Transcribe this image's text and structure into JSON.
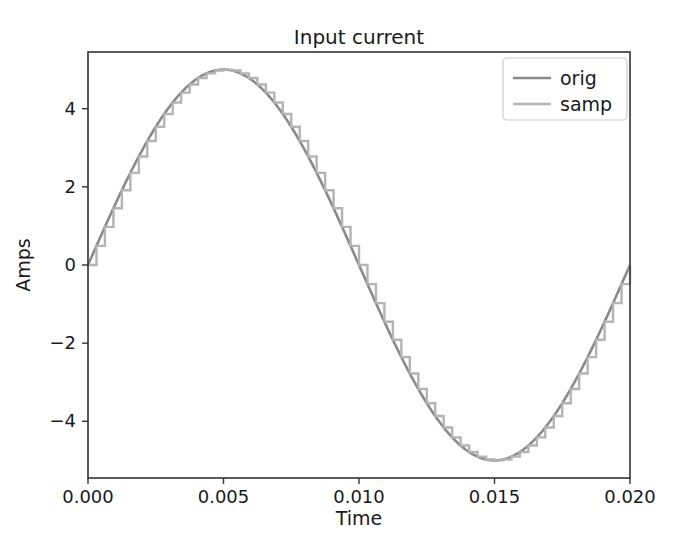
{
  "chart_data": {
    "type": "line",
    "title": "Input current",
    "xlabel": "Time",
    "ylabel": "Amps",
    "xlim": [
      0.0,
      0.02
    ],
    "ylim": [
      -5.45,
      5.45
    ],
    "xticks": [
      0.0,
      0.005,
      0.01,
      0.015,
      0.02
    ],
    "xticklabels": [
      "0.000",
      "0.005",
      "0.010",
      "0.015",
      "0.020"
    ],
    "yticks": [
      -4,
      -2,
      0,
      2,
      4
    ],
    "yticklabels": [
      "−4",
      "−2",
      "0",
      "2",
      "4"
    ],
    "grid": false,
    "legend_position": "upper right",
    "amplitude": 5,
    "frequency_hz": 50,
    "sample_count": 64,
    "series": [
      {
        "name": "orig",
        "style": "smooth-sine",
        "color": "#8a8a8a",
        "linewidth": 2.6,
        "description": "Continuous 50 Hz sine, amplitude 5 A, one full cycle over 0 to 0.02 s",
        "x": [
          0.0,
          0.0005,
          0.001,
          0.0015,
          0.002,
          0.0025,
          0.003,
          0.0035,
          0.004,
          0.0045,
          0.005,
          0.0055,
          0.006,
          0.0065,
          0.007,
          0.0075,
          0.008,
          0.0085,
          0.009,
          0.0095,
          0.01,
          0.0105,
          0.011,
          0.0115,
          0.012,
          0.0125,
          0.013,
          0.0135,
          0.014,
          0.0145,
          0.015,
          0.0155,
          0.016,
          0.0165,
          0.017,
          0.0175,
          0.018,
          0.0185,
          0.019,
          0.0195,
          0.02
        ],
        "y": [
          0.0,
          0.78,
          1.55,
          2.27,
          2.94,
          3.54,
          4.05,
          4.45,
          4.76,
          4.94,
          5.0,
          4.94,
          4.76,
          4.45,
          4.05,
          3.54,
          2.94,
          2.27,
          1.55,
          0.78,
          0.0,
          -0.78,
          -1.55,
          -2.27,
          -2.94,
          -3.54,
          -4.05,
          -4.45,
          -4.76,
          -4.94,
          -5.0,
          -4.94,
          -4.76,
          -4.45,
          -4.05,
          -3.54,
          -2.94,
          -2.27,
          -1.55,
          -0.78,
          0.0
        ]
      },
      {
        "name": "samp",
        "style": "zero-order-hold",
        "color": "#b4b4b4",
        "linewidth": 2.4,
        "description": "Zero-order-hold sampled version of the original sine, 64 samples per cycle",
        "x": [
          0.0,
          0.0005,
          0.001,
          0.0015,
          0.002,
          0.0025,
          0.003,
          0.0035,
          0.004,
          0.0045,
          0.005,
          0.0055,
          0.006,
          0.0065,
          0.007,
          0.0075,
          0.008,
          0.0085,
          0.009,
          0.0095,
          0.01,
          0.0105,
          0.011,
          0.0115,
          0.012,
          0.0125,
          0.013,
          0.0135,
          0.014,
          0.0145,
          0.015,
          0.0155,
          0.016,
          0.0165,
          0.017,
          0.0175,
          0.018,
          0.0185,
          0.019,
          0.0195,
          0.02
        ],
        "y": [
          0.0,
          0.78,
          1.55,
          2.27,
          2.94,
          3.54,
          4.05,
          4.45,
          4.76,
          4.94,
          5.0,
          4.94,
          4.76,
          4.45,
          4.05,
          3.54,
          2.94,
          2.27,
          1.55,
          0.78,
          0.0,
          -0.78,
          -1.55,
          -2.27,
          -2.94,
          -3.54,
          -4.05,
          -4.45,
          -4.76,
          -4.94,
          -5.0,
          -4.94,
          -4.76,
          -4.45,
          -4.05,
          -3.54,
          -2.94,
          -2.27,
          -1.55,
          -0.78,
          0.0
        ]
      }
    ]
  },
  "layout": {
    "plot_left": 88,
    "plot_right": 630,
    "plot_top": 52,
    "plot_bottom": 478,
    "legend_x": 503,
    "legend_y": 58,
    "legend_w": 124,
    "legend_h": 62
  }
}
